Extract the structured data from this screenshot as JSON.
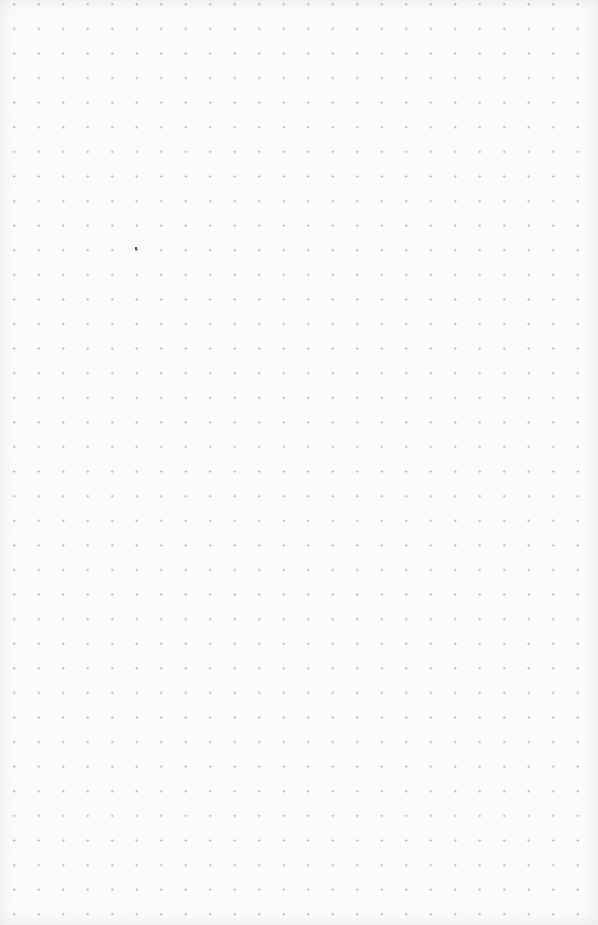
{
  "page": {
    "type": "dot-grid paper",
    "dot_color": "#b9b9b9",
    "background_color": "#fbfbfb",
    "dot_spacing_px": 24.5,
    "columns": 24,
    "rows": 38
  },
  "marks": [
    {
      "name": "stray-mark",
      "x": 135,
      "y": 247
    }
  ]
}
